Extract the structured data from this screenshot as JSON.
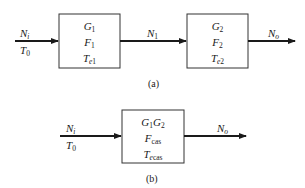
{
  "diagram": {
    "part_a": {
      "caption": "(a)",
      "input": {
        "signal": "N",
        "signal_sub": "i",
        "temp": "T",
        "temp_sub": "0"
      },
      "block1": {
        "gain": "G",
        "gain_sub": "1",
        "noise_figure": "F",
        "noise_figure_sub": "1",
        "temp": "T",
        "temp_sub_e": "e",
        "temp_sub_n": "1"
      },
      "intermediate": {
        "signal": "N",
        "signal_sub": "1"
      },
      "block2": {
        "gain": "G",
        "gain_sub": "2",
        "noise_figure": "F",
        "noise_figure_sub": "2",
        "temp": "T",
        "temp_sub_e": "e",
        "temp_sub_n": "2"
      },
      "output": {
        "signal": "N",
        "signal_sub": "o"
      }
    },
    "part_b": {
      "caption": "(b)",
      "input": {
        "signal": "N",
        "signal_sub": "i",
        "temp": "T",
        "temp_sub": "0"
      },
      "block": {
        "gain_a": "G",
        "gain_a_sub": "1",
        "gain_b": "G",
        "gain_b_sub": "2",
        "noise_figure": "F",
        "noise_figure_sub": "cas",
        "temp": "T",
        "temp_sub_e": "e",
        "temp_sub_rest": "cas"
      },
      "output": {
        "signal": "N",
        "signal_sub": "o"
      }
    },
    "colors": {
      "line": "#1a1a1a",
      "box_border": "#333333",
      "background": "#ffffff"
    }
  }
}
